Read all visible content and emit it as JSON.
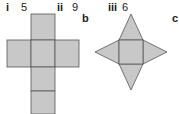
{
  "labels": {
    "i": {
      "roman": "i",
      "value": "5"
    },
    "ii": {
      "roman": "ii",
      "value": "9"
    },
    "iii": {
      "roman": "iii",
      "value": "6"
    },
    "b": "b",
    "c": "c"
  },
  "colors": {
    "fill": "#c8c8c8",
    "stroke": "#555555"
  }
}
